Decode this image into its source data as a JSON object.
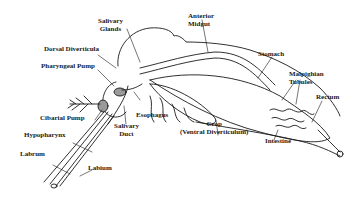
{
  "diagram": {
    "type": "anatomical-line-drawing",
    "colors": {
      "ink": "#1a1a1a",
      "background": "#ffffff",
      "tissue_shading": "#9a9a9a"
    },
    "labels": {
      "salivary_glands_1": "Salivary",
      "salivary_glands_2": "Glands",
      "anterior_midgut_1": "Anterior",
      "anterior_midgut_2": "Midgut",
      "dorsal_diverticula": "Dorsal Diverticula",
      "pharyngeal_pump": "Pharyngeal Pump",
      "stomach": "Stomach",
      "malpighian_tubules_1": "Malpighian",
      "malpighian_tubules_2": "Tubules",
      "rectum": "Rectum",
      "cibarial_pump": "Cibarial Pump",
      "esophagus": "Esophagus",
      "salivary_duct_1": "Salivary",
      "salivary_duct_2": "Duct",
      "hypopharynx": "Hypopharynx",
      "labrum": "Labrum",
      "labium": "Labium",
      "crop_1": "Crop",
      "crop_2": "(Ventral Diverticulum)",
      "intestine": "Intestine"
    }
  }
}
